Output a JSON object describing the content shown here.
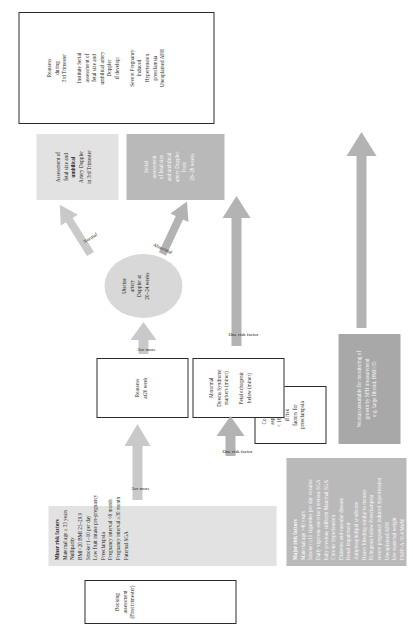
{
  "diagram": {
    "booking": {
      "line1": "Booking assessment",
      "line2": "(First trimester)"
    },
    "minor_risk": {
      "header": "Minor risk factors",
      "items": [
        "Maternal age ≥ 35 years",
        "Nulliparity",
        "BMI<20  BMI 25–29.9",
        "Smoker 1–10 per day",
        "Low fruit intake pre-pregnancy",
        "Preeclampsia",
        "Pregnancy interval <6 month",
        "Pregnancy interval ≥30 month",
        "Paternal SGA"
      ]
    },
    "major_risk": {
      "header": "Major risk factors",
      "items": [
        "Maternal age >40 years",
        "Smoker ≥11 cigarettes per day cocaine",
        "Daily vigorous exercise previous SGA",
        "baby previous stillbirth Maternal SGA",
        "Chronic hypertension",
        "Diabetes and vascular disease",
        "Renal impairment",
        "Antiphospholipid syndrome",
        "Heavy bleeding similar to menses",
        "Echogenic below Preeclampsia",
        "severe pregnancy induced hypertension",
        "Unexplained APH",
        "low maternal weight",
        "PAPP-A <0.4 MoM"
      ]
    },
    "unsuitable": {
      "lines": [
        "Woman unsuitable for monitoring of",
        "growth by SFH measurement",
        "e.g. large fibroid, BMI>35"
      ]
    },
    "aspirin": {
      "lines": [
        "Consider",
        "aspirin at",
        "< 16 weeks",
        "if risk",
        "factors for",
        "preeclampsia"
      ]
    },
    "reassess20": {
      "lines": [
        "Reassess",
        "at20 week"
      ]
    },
    "abnormal_markers": {
      "lines": [
        "Abnormal",
        "Downs Syndrome",
        "markers (minor)",
        "",
        "Fetal echogenic",
        "below (minor)"
      ]
    },
    "uterine": {
      "lines": [
        "Uterine",
        "artery",
        "Doppler at",
        "20–24 weeks"
      ]
    },
    "assessment_3rd": {
      "plain1": "Assessment of",
      "plain2": "fetal size and",
      "bold": "umbilical",
      "plain3": "Artery Doppler",
      "plain4": "in 3rd Trimester"
    },
    "serial_2628": {
      "lines": [
        "Serial",
        "assessment",
        "of fetal size",
        "and umbilical",
        "artery Doppler",
        "from",
        "26–28 weeks"
      ]
    },
    "third_trimester": {
      "lines": [
        "Reassess",
        "during",
        "3rd Trimester",
        "",
        "Institute Serial",
        "assessment of",
        "fetal size and",
        "umbilical artery",
        "Doppler",
        "if develop:",
        "",
        "Severe Pregnancy",
        "Induced",
        "Hypertension",
        "preeclamsia",
        "Unexplained APH"
      ]
    },
    "arrows": {
      "three_or_more_1": "3or more",
      "three_or_more_2": "3or more",
      "one_risk_1": "One risk factor",
      "one_risk_2": "One risk factor",
      "normal": "Normal",
      "abnormal": "Abnormal"
    },
    "colors": {
      "grey_light": "#e2e2e2",
      "grey_mid": "#b9b9b9",
      "grey_dark": "#a8a8a8",
      "arrow": "#c9c9c9",
      "border": "#2b2b2b"
    }
  }
}
